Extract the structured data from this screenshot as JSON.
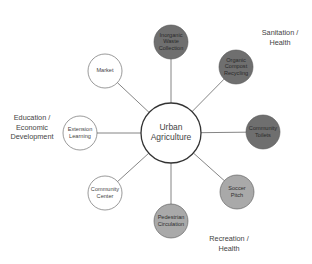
{
  "diagram": {
    "type": "hub-and-spoke",
    "center": {
      "label_lines": [
        "Urban",
        "Agriculture"
      ],
      "x": 171,
      "y": 133,
      "r": 30,
      "fill": "#ffffff"
    },
    "node_radius": 17,
    "nodes": [
      {
        "id": "inorganic-waste-collection",
        "label_lines": [
          "Inorganic",
          "Waste",
          "Collection"
        ],
        "x": 171,
        "y": 42,
        "group": "sanitation"
      },
      {
        "id": "organic-compost-recycling",
        "label_lines": [
          "Organic",
          "Compost",
          "Recycling"
        ],
        "x": 236,
        "y": 67,
        "group": "sanitation"
      },
      {
        "id": "community-toilets",
        "label_lines": [
          "Community",
          "Toilets"
        ],
        "x": 263,
        "y": 132,
        "group": "sanitation"
      },
      {
        "id": "soccer-pitch",
        "label_lines": [
          "Soccer",
          "Pitch"
        ],
        "x": 237,
        "y": 192,
        "group": "recreation"
      },
      {
        "id": "pedestrian-circulation",
        "label_lines": [
          "Pedestrian",
          "Circulation"
        ],
        "x": 171,
        "y": 221,
        "group": "recreation"
      },
      {
        "id": "community-center",
        "label_lines": [
          "Community",
          "Center"
        ],
        "x": 105,
        "y": 193,
        "group": "education"
      },
      {
        "id": "extension-learning",
        "label_lines": [
          "Extension",
          "Learning"
        ],
        "x": 80,
        "y": 133,
        "group": "education"
      },
      {
        "id": "market",
        "label_lines": [
          "Market"
        ],
        "x": 105,
        "y": 71,
        "group": "education"
      }
    ],
    "groups": {
      "sanitation": {
        "fill": "#6f6f6f",
        "text": "#2a2a2a"
      },
      "recreation": {
        "fill": "#a9a9a9",
        "text": "#2e2e2e"
      },
      "education": {
        "fill": "#ffffff",
        "text": "#444444"
      }
    },
    "group_labels": [
      {
        "id": "sanitation-health",
        "lines": [
          "Sanitation /",
          "Health"
        ],
        "x": 280,
        "y": 38
      },
      {
        "id": "education-economic-development",
        "lines": [
          "Education /",
          "Economic",
          "Development"
        ],
        "x": 32,
        "y": 128
      },
      {
        "id": "recreation-health",
        "lines": [
          "Recreation /",
          "Health"
        ],
        "x": 229,
        "y": 244
      }
    ],
    "colors": {
      "stroke": "#555555",
      "spoke": "#777777",
      "background": "#ffffff"
    }
  }
}
